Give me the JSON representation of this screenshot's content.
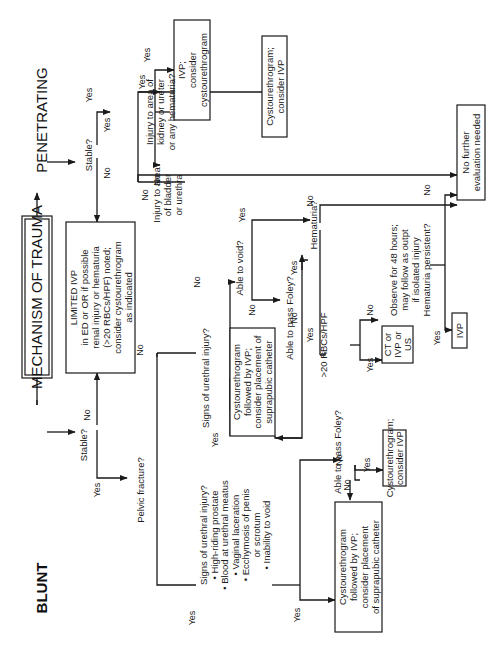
{
  "title": "MECHANISM OF TRAUMA",
  "branches": {
    "blunt": "BLUNT",
    "penetrating": "PENETRATING"
  },
  "labels": {
    "yes": "Yes",
    "no": "No"
  },
  "nodes": {
    "stable_blunt": [
      "Stable?"
    ],
    "stable_pen": [
      "Stable?"
    ],
    "limited_ivp": [
      "LIMITED IVP",
      "in ED or OR if possible",
      "renal injury or hematuria",
      "(>20 RBCs/HPF) noted;",
      "consider cystourethrogram",
      "as indicated"
    ],
    "kidney_q": [
      "Injury to area of",
      "kidney or ureter",
      "or any hematuria?"
    ],
    "ivp_consider": [
      "IVP;",
      "consider",
      "cystourethrogram"
    ],
    "bladder_q": [
      "Injury to area",
      "of bladder",
      "or urethra"
    ],
    "cysto_consider_ivp_top": [
      "Cystourethrogram;",
      "consider IVP"
    ],
    "no_further": [
      "No further",
      "evaluation needed"
    ],
    "pelvic_q": [
      "Pelvic fracture?"
    ],
    "urethral_q_simple": [
      "Signs of urethral injury?"
    ],
    "urethral_q_list": [
      "Signs of urethral injury?",
      "• High-riding prostate",
      "• Blood at urethral meatus",
      "• Vaginal laceration",
      "• Ecchymosis of penis",
      "or scrotum",
      "• Inability to void"
    ],
    "cysto_suprapubic_mid": [
      "Cystourethrogram",
      "followed by IVP;",
      "consider placement of",
      "suprapubic catheter"
    ],
    "cysto_suprapubic_low": [
      "Cystourethrogram",
      "followed by IVP;",
      "consider placement",
      "of suprapubic catheter"
    ],
    "able_void": [
      "Able to void?"
    ],
    "able_foley_mid": [
      "Able to pass Foley?"
    ],
    "able_foley_low": [
      "Able to pass Foley?"
    ],
    "cysto_consider_ivp_low": [
      "Cystourethrogram;",
      "consider IVP"
    ],
    "hematuria_q": [
      "Hematuria?"
    ],
    "rbc_q": [
      ">20 RBCs/HPF"
    ],
    "ct_ivp_us": [
      "CT or",
      "IVP or",
      "US"
    ],
    "observe": [
      "Observe for 48 hours;",
      "may follow as outpt",
      "if isolated injury",
      "Hematuria persistent?"
    ],
    "ivp_final": [
      "IVP"
    ]
  }
}
